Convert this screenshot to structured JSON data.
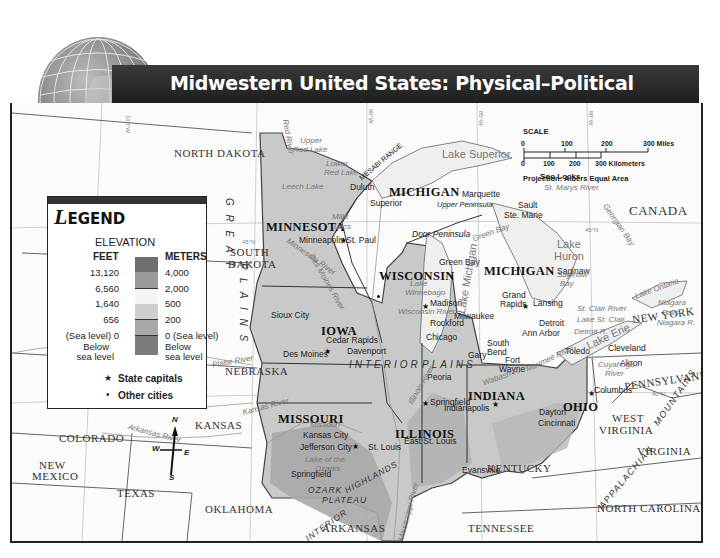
{
  "title": "Midwestern United States: Physical–Political",
  "legend": {
    "title_initial": "L",
    "title_rest": "EGEND",
    "elevation_label": "ELEVATION",
    "feet_header": "FEET",
    "meters_header": "METERS",
    "rows": [
      {
        "feet": "13,120",
        "meters": "4,000",
        "color": "#6e6e6e"
      },
      {
        "feet": "6,560",
        "meters": "2,000",
        "color": "#9a9a9a"
      },
      {
        "feet": "1,640",
        "meters": "500",
        "color": "#f4f4f4"
      },
      {
        "feet": "656",
        "meters": "200",
        "color": "#cfcfcf"
      },
      {
        "feet": "(Sea level) 0",
        "meters": "0 (Sea level)",
        "color": "#a8a8a8"
      },
      {
        "feet": "Below",
        "meters": "Below",
        "color": "#7c7c7c"
      }
    ],
    "below_line2_feet": "sea level",
    "below_line2_meters": "sea level",
    "state_capitals": "State capitals",
    "other_cities": "Other cities"
  },
  "scale": {
    "label": "SCALE",
    "miles_ticks": [
      "0",
      "100",
      "200",
      "300 Miles"
    ],
    "km_ticks": [
      "0",
      "100",
      "200",
      "300 Kilometers"
    ],
    "projection": "Projection: Albers Equal Area"
  },
  "compass": {
    "n": "N",
    "s": "S",
    "e": "E",
    "w": "W"
  },
  "states_midwest": {
    "minnesota": "MINNESOTA",
    "wisconsin": "WISCONSIN",
    "michigan_upper": "MICHIGAN",
    "michigan_lower": "MICHIGAN",
    "iowa": "IOWA",
    "illinois": "ILLINOIS",
    "indiana": "INDIANA",
    "ohio": "OHIO",
    "missouri": "MISSOURI"
  },
  "states_other": {
    "north_dakota": "NORTH DAKOTA",
    "south_dakota_1": "SOUTH",
    "south_dakota_2": "DAKOTA",
    "nebraska": "NEBRASKA",
    "kansas": "KANSAS",
    "colorado": "COLORADO",
    "new_mexico_1": "NEW",
    "new_mexico_2": "MEXICO",
    "texas": "TEXAS",
    "oklahoma": "OKLAHOMA",
    "arkansas": "ARKANSAS",
    "tennessee": "TENNESSEE",
    "kentucky": "KENTUCKY",
    "west_virginia_1": "WEST",
    "west_virginia_2": "VIRGINIA",
    "virginia": "VIRGINIA",
    "north_carolina": "NORTH CAROLINA",
    "pennsylvania": "PENNSYLVANIA",
    "new_york": "NEW YORK",
    "canada": "CANADA"
  },
  "capitals": {
    "st_paul": "St. Paul",
    "madison": "Madison",
    "lansing": "Lansing",
    "des_moines": "Des Moines",
    "springfield_il": "Springfield",
    "indianapolis": "Indianapolis",
    "columbus": "Columbus",
    "jefferson_city": "Jefferson City"
  },
  "cities": {
    "duluth": "Duluth",
    "superior": "Superior",
    "minneapolis": "Minneapolis",
    "marquette": "Marquette",
    "sault_1": "Sault",
    "sault_2": "Ste. Marie",
    "green_bay": "Green Bay",
    "milwaukee": "Milwaukee",
    "grand_rapids_1": "Grand",
    "grand_rapids_2": "Rapids",
    "saginaw": "Saginaw",
    "detroit": "Detroit",
    "ann_arbor": "Ann Arbor",
    "toledo": "Toledo",
    "cleveland": "Cleveland",
    "akron": "Akron",
    "sioux_city": "Sioux City",
    "cedar_rapids": "Cedar Rapids",
    "davenport": "Davenport",
    "rockford": "Rockford",
    "chicago": "Chicago",
    "gary": "Gary",
    "south_bend_1": "South",
    "south_bend_2": "Bend",
    "fort_wayne_1": "Fort",
    "fort_wayne_2": "Wayne",
    "peoria": "Peoria",
    "kansas_city": "Kansas City",
    "st_louis": "St. Louis",
    "east_st_louis": "East St. Louis",
    "springfield_mo": "Springfield",
    "evansville": "Evansville",
    "dayton": "Dayton",
    "cincinnati": "Cincinnati"
  },
  "features": {
    "soo_locks": "Soo Locks",
    "mesabi_range": "MESABI RANGE",
    "door_peninsula": "Door Peninsula",
    "upper_peninsula": "Upper Peninsula",
    "great": "G R E A T",
    "plains": "P L A I N S",
    "interior_plains_1": "INTERIOR",
    "interior_plains_2": "PLAINS",
    "ozark": "OZARK",
    "plateau": "PLATEAU",
    "interior_highlands_1": "INTERIOR",
    "interior_highlands_2": "HIGHLANDS",
    "appalachian": "APPALACHIAN",
    "mountains": "MOUNTAINS"
  },
  "water": {
    "lake_superior": "Lake Superior",
    "lake_michigan": "Lake Michigan",
    "lake_huron_1": "Lake",
    "lake_huron_2": "Huron",
    "lake_erie": "Lake Erie",
    "lake_ontario": "Lake Ontario",
    "lake_st_clair": "Lake St. Clair",
    "st_clair_river": "St. Clair River",
    "detroit_river": "Detroit R.",
    "niagara_falls_1": "Niagara",
    "niagara_falls_2": "Falls",
    "niagara_river": "Niagara R.",
    "st_marys_river": "St. Marys River",
    "georgian_bay": "Georgian Bay",
    "saginaw_bay_1": "Saginaw",
    "saginaw_bay_2": "Bay",
    "green_bay_water": "Green Bay",
    "lake_winnebago_1": "Lake",
    "lake_winnebago_2": "Winnebago",
    "upper_red_lake_1": "Upper",
    "upper_red_lake_2": "Red Lake",
    "lower_red_lake_1": "Lower",
    "lower_red_lake_2": "Red Lake",
    "leech_lake": "Leech Lake",
    "mille_lacs_1": "Mille",
    "mille_lacs_2": "Lacs",
    "red_river": "Red River",
    "lake_of_the_ozarks_1": "Lake of the",
    "lake_of_the_ozarks_2": "Ozarks",
    "cuyahoga_1": "Cuyahoga",
    "cuyahoga_2": "River",
    "maumee_river": "Maumee River",
    "wabash_river": "Wabash R.",
    "wisconsin_river": "Wisconsin River",
    "des_moines_river": "Des Moines River",
    "missouri_river": "Missouri",
    "platte_river": "Platte River",
    "kansas_river": "Kansas River",
    "arkansas_river": "Arkansas River",
    "mississippi_river": "Mississippi River",
    "minnesota_river": "Minnesota River",
    "illinois_river": "Illinois River"
  },
  "coordinates": {
    "lat_45_w": "45°N",
    "lat_45_e": "45°N",
    "lat_40_w": "40°N",
    "lat_40_e": "40°N",
    "lon_100": "100°W",
    "lon_95": "95°W",
    "lon_90": "90°W",
    "lon_85": "85°W",
    "lon_80": "80°W",
    "lon_105": "105°W"
  },
  "colors": {
    "title_bar": "#2a2a2a",
    "midwest_fill": "#c9c9c9",
    "highland_fill": "#a3a3a3",
    "water": "#e9e9e9",
    "background": "#fbfbfb"
  }
}
